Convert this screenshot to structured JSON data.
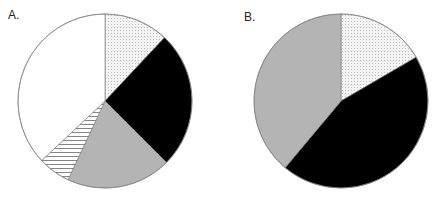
{
  "chart_data": [
    {
      "type": "pie",
      "title": "A.",
      "start_angle_deg": 0,
      "direction": "clockwise",
      "slices": [
        {
          "name": "dotted",
          "value": 12.0,
          "fill": "dotted"
        },
        {
          "name": "black",
          "value": 25.5,
          "fill": "#000000"
        },
        {
          "name": "gray",
          "value": 19.5,
          "fill": "#b4b4b4"
        },
        {
          "name": "hatched",
          "value": 6.0,
          "fill": "hatched"
        },
        {
          "name": "white",
          "value": 37.0,
          "fill": "#ffffff"
        }
      ]
    },
    {
      "type": "pie",
      "title": "B.",
      "start_angle_deg": 0,
      "direction": "clockwise",
      "slices": [
        {
          "name": "dotted",
          "value": 16.6,
          "fill": "dotted"
        },
        {
          "name": "black",
          "value": 44.5,
          "fill": "#000000"
        },
        {
          "name": "gray",
          "value": 38.9,
          "fill": "#b4b4b4"
        }
      ]
    }
  ],
  "panels": [
    {
      "label": "A.",
      "cx": 105,
      "cy": 101,
      "r": 87
    },
    {
      "label": "B.",
      "cx": 341,
      "cy": 101,
      "r": 87
    }
  ]
}
